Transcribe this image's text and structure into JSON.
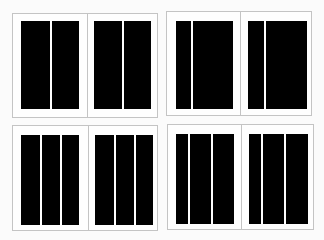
{
  "diagram": {
    "title": "",
    "colors": {
      "column": "#000000",
      "page_border": "#c4c4c4",
      "background": "#fbfbfb"
    },
    "spreads": [
      {
        "id": "two-equal-columns",
        "box": [
          12,
          13,
          146,
          105
        ],
        "spine_x": 74,
        "pages": [
          {
            "block": [
              8,
              7,
              58,
              88
            ],
            "gutters": [
              [
                29,
                2
              ]
            ]
          },
          {
            "block": [
              81,
              7,
              57,
              88
            ],
            "gutters": [
              [
                28,
                2
              ]
            ]
          }
        ]
      },
      {
        "id": "narrow-wide-columns",
        "box": [
          166,
          11,
          146,
          105
        ],
        "spine_x": 73,
        "pages": [
          {
            "block": [
              9,
              9,
              57,
              88
            ],
            "gutters": [
              [
                15,
                2
              ]
            ]
          },
          {
            "block": [
              81,
              9,
              59,
              88
            ],
            "gutters": [
              [
                16,
                2
              ]
            ]
          }
        ]
      },
      {
        "id": "three-equal-columns",
        "box": [
          12,
          125,
          146,
          106
        ],
        "spine_x": 75,
        "pages": [
          {
            "block": [
              8,
              9,
              58,
              90
            ],
            "gutters": [
              [
                19,
                2
              ],
              [
                39,
                2
              ]
            ]
          },
          {
            "block": [
              82,
              9,
              58,
              90
            ],
            "gutters": [
              [
                19,
                2
              ],
              [
                39,
                2
              ]
            ]
          }
        ]
      },
      {
        "id": "narrow-plus-two-columns",
        "box": [
          167,
          124,
          147,
          106
        ],
        "spine_x": 73,
        "pages": [
          {
            "block": [
              8,
              9,
              58,
              90
            ],
            "gutters": [
              [
                12,
                2
              ],
              [
                35,
                2
              ]
            ]
          },
          {
            "block": [
              81,
              9,
              59,
              90
            ],
            "gutters": [
              [
                12,
                2
              ],
              [
                35,
                2
              ]
            ]
          }
        ]
      }
    ]
  }
}
